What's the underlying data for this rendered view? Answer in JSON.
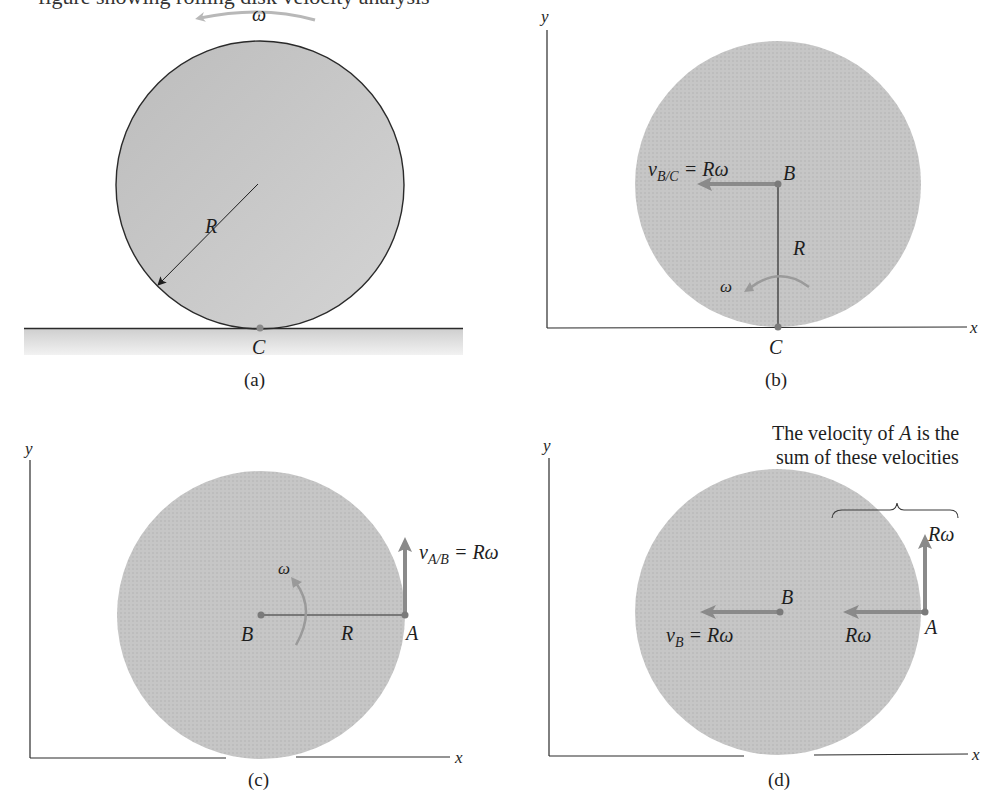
{
  "header_partial_text": "figure showing rolling disk velocity analysis",
  "colors": {
    "disk_fill": "#c4c4c4",
    "ground_fill": "#d8d8d8",
    "vector": "#8a8a8a",
    "omega_arrow_a": "#b8b8b8",
    "omega_arrow": "#9a9a9a",
    "line": "#2a2a2a"
  },
  "panels": {
    "a": {
      "caption": "(a)",
      "omega": "ω",
      "radius_label": "R",
      "contact_point": "C"
    },
    "b": {
      "caption": "(b)",
      "y_axis": "y",
      "x_axis": "x",
      "velocity_label_main": "v",
      "velocity_label_sub": "B/C",
      "velocity_label_rhs": " = Rω",
      "point_B": "B",
      "point_C": "C",
      "radius_label": "R",
      "omega": "ω"
    },
    "c": {
      "caption": "(c)",
      "y_axis": "y",
      "x_axis": "x",
      "velocity_label_main": "v",
      "velocity_label_sub": "A/B",
      "velocity_label_rhs": " = Rω",
      "point_B": "B",
      "point_A": "A",
      "radius_label": "R",
      "omega": "ω"
    },
    "d": {
      "caption": "(d)",
      "y_axis": "y",
      "x_axis": "x",
      "note_line1": "The velocity of A is the",
      "note_line1_pre": "The velocity of ",
      "note_line1_var": "A",
      "note_line1_post": " is the",
      "note_line2": "sum of these velocities",
      "point_B": "B",
      "point_A": "A",
      "vb_main": "v",
      "vb_sub": "B",
      "vb_rhs": " = Rω",
      "up_label": "Rω",
      "left_label": "Rω"
    }
  }
}
